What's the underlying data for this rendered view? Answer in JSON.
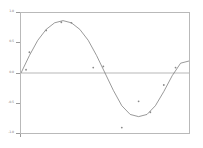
{
  "figure": {
    "background_color": "#ffffff",
    "frame_color": "#b9b9b9",
    "axis_color": "#9a9a9a"
  },
  "chart_data": {
    "type": "scatter",
    "title": "",
    "xlabel": "",
    "ylabel": "",
    "xlim": [
      0,
      1
    ],
    "ylim": [
      -1.1,
      1.1
    ],
    "grid": false,
    "legend": null,
    "zero_line": 0,
    "yticks": [
      1.0,
      0.5,
      0.0,
      -0.5,
      -1.0
    ],
    "ytick_labels": [
      "1.0",
      "0.5",
      "0.0",
      "-0.5",
      "-1.0"
    ],
    "xticks": [
      0
    ],
    "xtick_labels": [
      ""
    ],
    "series": [
      {
        "name": "data",
        "type": "scatter",
        "marker": "dot",
        "color": "#8a8a8a",
        "x": [
          0.03,
          0.05,
          0.15,
          0.24,
          0.3,
          0.43,
          0.49,
          0.6,
          0.7,
          0.77,
          0.85,
          0.92
        ],
        "y": [
          0.06,
          0.38,
          0.78,
          0.93,
          0.92,
          0.1,
          0.12,
          -1.0,
          -0.52,
          -0.72,
          -0.22,
          0.1
        ]
      },
      {
        "name": "fit",
        "type": "line",
        "color": "#6e6e6e",
        "description": "sine-like smooth fit through the scattered points",
        "x": [
          0.0,
          0.05,
          0.1,
          0.15,
          0.2,
          0.25,
          0.3,
          0.35,
          0.4,
          0.45,
          0.5,
          0.55,
          0.6,
          0.65,
          0.7,
          0.75,
          0.8,
          0.85,
          0.9,
          0.95,
          1.0
        ],
        "y": [
          0.0,
          0.32,
          0.6,
          0.8,
          0.92,
          0.96,
          0.92,
          0.8,
          0.6,
          0.32,
          0.0,
          -0.32,
          -0.6,
          -0.76,
          -0.8,
          -0.76,
          -0.6,
          -0.34,
          -0.05,
          0.18,
          0.22
        ]
      }
    ]
  }
}
